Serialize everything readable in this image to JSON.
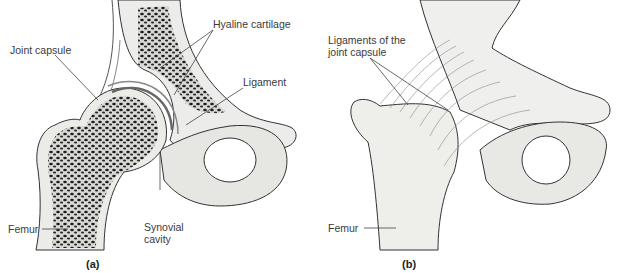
{
  "figure": {
    "panels": [
      {
        "id": "a",
        "caption": "(a)",
        "view": "Frontal section",
        "labels": {
          "joint_capsule": "Joint capsule",
          "hyaline_cartilage": "Hyaline cartilage",
          "ligament": "Ligament",
          "femur": "Femur",
          "synovial_cavity_line1": "Synovial",
          "synovial_cavity_line2": "cavity"
        }
      },
      {
        "id": "b",
        "caption": "(b)",
        "view": "Anterior view",
        "labels": {
          "ligaments_line1": "Ligaments of the",
          "ligaments_line2": "joint capsule",
          "femur": "Femur"
        }
      }
    ]
  },
  "colors": {
    "background": "#ffffff",
    "bone_fill": "#e9e9e6",
    "bone_outline": "#333333",
    "spongy_bone": "#2a2a2a",
    "cartilage": "#d4d4d0",
    "leader_line": "#444444",
    "label_text": "#3a3a3a"
  }
}
